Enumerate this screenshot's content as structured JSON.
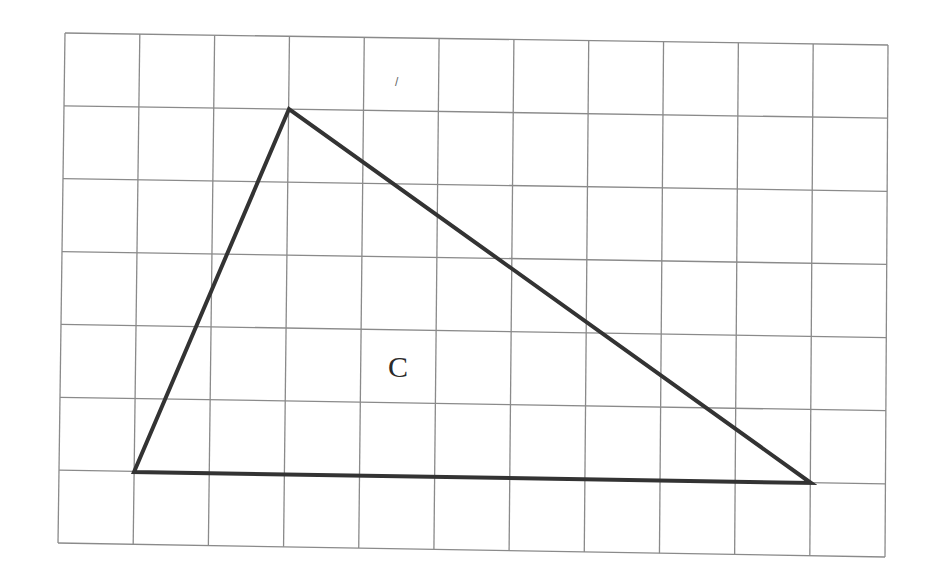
{
  "diagram": {
    "type": "grid-triangle",
    "grid": {
      "columns": 11,
      "rows": 7,
      "corners": {
        "top_left": [
          65,
          33
        ],
        "top_right": [
          888,
          45
        ],
        "bottom_left": [
          58,
          543
        ],
        "bottom_right": [
          885,
          557
        ]
      },
      "line_color": "#8a8a8a"
    },
    "triangle": {
      "label": "C",
      "label_position": [
        398,
        377
      ],
      "vertices": [
        [
          289,
          109
        ],
        [
          134,
          472
        ],
        [
          811,
          483
        ]
      ],
      "vertices_grid_units": [
        [
          3,
          1
        ],
        [
          1,
          6
        ],
        [
          10,
          6
        ]
      ],
      "stroke_color": "#333333",
      "stroke_width": 4
    },
    "stray_mark": {
      "text": "/",
      "position": [
        395,
        86
      ]
    }
  }
}
